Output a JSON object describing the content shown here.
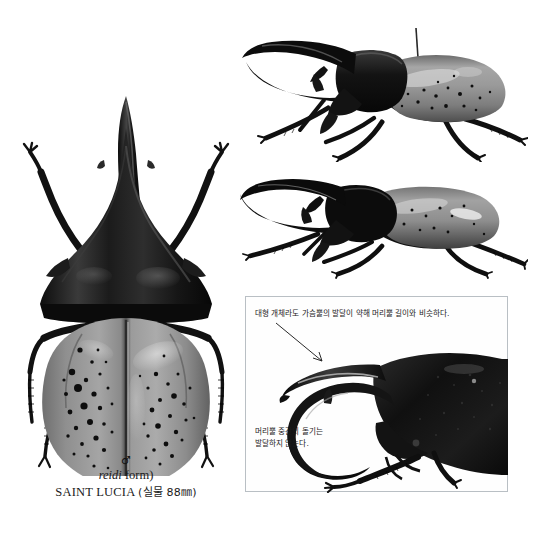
{
  "page": {
    "background_color": "#ffffff",
    "type": "field-guide-plate"
  },
  "dorsal_specimen": {
    "name": "hercules-beetle-dorsal-view",
    "caption": {
      "sex_symbol": "♂",
      "sex_symbol_name": "male-symbol",
      "form": "(reidi form)",
      "form_italic_part": "reidi",
      "form_roman_part": " form)",
      "locality": "SAINT LUCIA",
      "size_note": "(실물 88㎜)",
      "full_locality_line": "SAINT LUCIA (실물 88㎜)"
    }
  },
  "lateral_specimens": [
    {
      "name": "hercules-beetle-lateral-view-upper",
      "has_pin": true
    },
    {
      "name": "hercules-beetle-lateral-view-lower",
      "has_pin": false
    }
  ],
  "detail_inset": {
    "border_color": "#b9bfc4",
    "photo_name": "hercules-beetle-head-thorax-closeup",
    "annotations": [
      {
        "id": "thoracic-horn-note",
        "text": "대형 개체라도 가슴뿔의 발달이 약해 머리뿔 길이와 비슷하다.",
        "leader": "arrow-down-right"
      },
      {
        "id": "head-horn-tubercle-note",
        "line1": "머리뿔 중간의 돌기는",
        "line2": "발달하지 않는다.",
        "text": "머리뿔 중간의 돌기는 발달하지 않는다.",
        "leader": "arrow-up-right"
      }
    ]
  },
  "colors": {
    "chitin_dark": "#141414",
    "elytra_gray": "#8d8d8d",
    "elytra_light": "#b9b9b9",
    "text": "#1a1a1a",
    "border": "#b9bfc4"
  }
}
